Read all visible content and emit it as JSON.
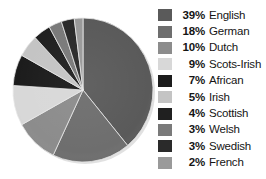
{
  "chart_data": {
    "type": "pie",
    "title": "",
    "subtitle": "",
    "xlabel": "",
    "ylabel": "",
    "grid": false,
    "legend_position": "right",
    "start_angle_deg": 0,
    "direction": "clockwise",
    "categories": [
      "English",
      "German",
      "Dutch",
      "Scots-Irish",
      "African",
      "Irish",
      "Scottish",
      "Welsh",
      "Swedish",
      "French"
    ],
    "values": [
      39,
      18,
      10,
      9,
      7,
      5,
      4,
      3,
      3,
      2
    ],
    "value_suffix": "%",
    "colors": [
      "#5a5a5a",
      "#6e6e6e",
      "#8c8c8c",
      "#d8d8d8",
      "#1c1c1c",
      "#c4c4c4",
      "#202020",
      "#7a7a7a",
      "#2a2a2a",
      "#9a9a9a"
    ],
    "slices": [
      {
        "label": "English",
        "value": 39,
        "display": "39%",
        "color": "#5a5a5a"
      },
      {
        "label": "German",
        "value": 18,
        "display": "18%",
        "color": "#6e6e6e"
      },
      {
        "label": "Dutch",
        "value": 10,
        "display": "10%",
        "color": "#8c8c8c"
      },
      {
        "label": "Scots-Irish",
        "value": 9,
        "display": "9%",
        "color": "#d8d8d8"
      },
      {
        "label": "African",
        "value": 7,
        "display": "7%",
        "color": "#1c1c1c"
      },
      {
        "label": "Irish",
        "value": 5,
        "display": "5%",
        "color": "#c4c4c4"
      },
      {
        "label": "Scottish",
        "value": 4,
        "display": "4%",
        "color": "#202020"
      },
      {
        "label": "Welsh",
        "value": 3,
        "display": "3%",
        "color": "#7a7a7a"
      },
      {
        "label": "Swedish",
        "value": 3,
        "display": "3%",
        "color": "#2a2a2a"
      },
      {
        "label": "French",
        "value": 2,
        "display": "2%",
        "color": "#9a9a9a"
      }
    ],
    "total": 100
  },
  "legend": {
    "items": [
      {
        "pct": "39%",
        "label": "English",
        "color": "#5a5a5a"
      },
      {
        "pct": "18%",
        "label": "German",
        "color": "#6e6e6e"
      },
      {
        "pct": "10%",
        "label": "Dutch",
        "color": "#8c8c8c"
      },
      {
        "pct": "9%",
        "label": "Scots-Irish",
        "color": "#d8d8d8"
      },
      {
        "pct": "7%",
        "label": "African",
        "color": "#1c1c1c"
      },
      {
        "pct": "5%",
        "label": "Irish",
        "color": "#c4c4c4"
      },
      {
        "pct": "4%",
        "label": "Scottish",
        "color": "#202020"
      },
      {
        "pct": "3%",
        "label": "Welsh",
        "color": "#7a7a7a"
      },
      {
        "pct": "3%",
        "label": "Swedish",
        "color": "#2a2a2a"
      },
      {
        "pct": "2%",
        "label": "French",
        "color": "#9a9a9a"
      }
    ]
  }
}
